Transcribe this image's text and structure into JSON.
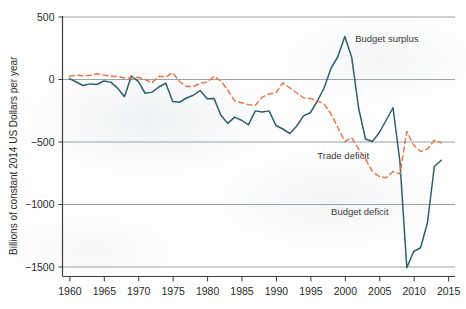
{
  "chart_data": {
    "type": "line",
    "title": "",
    "xlabel": "",
    "ylabel": "Billions of constant 2014 US Dollars per year",
    "xlim": [
      1959,
      2016
    ],
    "ylim": [
      -1600,
      620
    ],
    "grid": true,
    "legend_position": "inline-annotations",
    "xticks": [
      1960,
      1965,
      1970,
      1975,
      1980,
      1985,
      1990,
      1995,
      2000,
      2005,
      2010,
      2015
    ],
    "yticks": [
      500,
      0,
      -500,
      -1000,
      -1500
    ],
    "ytick_labels": [
      "500",
      "0",
      "−500",
      "−1000",
      "−1500"
    ],
    "annotations": [
      {
        "text": "Budget surplus",
        "x": 2001.5,
        "y": 300
      },
      {
        "text": "Trade deficit",
        "x": 1996.0,
        "y": -640
      },
      {
        "text": "Budget deficit",
        "x": 1998.0,
        "y": -1090
      }
    ],
    "series": [
      {
        "name": "Federal budget balance",
        "style": "solid",
        "color": "#2e5f6e",
        "x": [
          1960,
          1961,
          1962,
          1963,
          1964,
          1965,
          1966,
          1967,
          1968,
          1969,
          1970,
          1971,
          1972,
          1973,
          1974,
          1975,
          1976,
          1977,
          1978,
          1979,
          1980,
          1981,
          1982,
          1983,
          1984,
          1985,
          1986,
          1987,
          1988,
          1989,
          1990,
          1991,
          1992,
          1993,
          1994,
          1995,
          1996,
          1997,
          1998,
          1999,
          2000,
          2001,
          2002,
          2003,
          2004,
          2005,
          2006,
          2007,
          2008,
          2009,
          2010,
          2011,
          2012,
          2013,
          2014
        ],
        "values": [
          3,
          -24,
          -52,
          -39,
          -44,
          -16,
          -25,
          -73,
          -142,
          24,
          -19,
          -114,
          -105,
          -64,
          -34,
          -180,
          -186,
          -152,
          -130,
          -92,
          -158,
          -155,
          -290,
          -355,
          -305,
          -330,
          -367,
          -255,
          -264,
          -255,
          -372,
          -400,
          -436,
          -378,
          -295,
          -270,
          -178,
          -70,
          86,
          180,
          340,
          173,
          -232,
          -480,
          -500,
          -430,
          -330,
          -230,
          -660,
          -1510,
          -1380,
          -1350,
          -1150,
          -700,
          -650
        ]
      },
      {
        "name": "Trade balance",
        "style": "dashed",
        "color": "#e07b4f",
        "x": [
          1960,
          1961,
          1962,
          1963,
          1964,
          1965,
          1966,
          1967,
          1968,
          1969,
          1970,
          1971,
          1972,
          1973,
          1974,
          1975,
          1976,
          1977,
          1978,
          1979,
          1980,
          1981,
          1982,
          1983,
          1984,
          1985,
          1986,
          1987,
          1988,
          1989,
          1990,
          1991,
          1992,
          1993,
          1994,
          1995,
          1996,
          1997,
          1998,
          1999,
          2000,
          2001,
          2002,
          2003,
          2004,
          2005,
          2006,
          2007,
          2008,
          2009,
          2010,
          2011,
          2012,
          2013,
          2014
        ],
        "values": [
          22,
          30,
          26,
          30,
          42,
          32,
          22,
          20,
          8,
          8,
          14,
          -5,
          -30,
          22,
          16,
          50,
          -20,
          -60,
          -60,
          -35,
          -25,
          20,
          -15,
          -90,
          -175,
          -190,
          -205,
          -210,
          -145,
          -120,
          -110,
          -30,
          -70,
          -110,
          -150,
          -155,
          -175,
          -200,
          -280,
          -390,
          -500,
          -470,
          -560,
          -640,
          -740,
          -780,
          -790,
          -740,
          -760,
          -420,
          -530,
          -580,
          -560,
          -490,
          -510
        ]
      }
    ]
  },
  "axis": {
    "y_title": "Billions of constant 2014 US Dollars per year"
  },
  "icons": {
    "chart_type": "line-chart-icon"
  }
}
